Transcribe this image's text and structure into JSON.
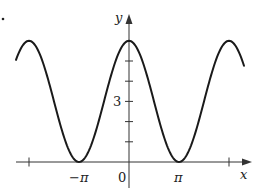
{
  "chart_data": {
    "type": "line",
    "title": "",
    "function": "y = 3 + 3cos(x)",
    "xlabel": "x",
    "ylabel": "y",
    "x_tick_labels": [
      "−π",
      "0",
      "π"
    ],
    "x_ticks": [
      "-2π",
      "-π",
      "0",
      "π",
      "2π"
    ],
    "y_tick_labels": [
      "3"
    ],
    "y_ticks": [
      1,
      2,
      3,
      4,
      5
    ],
    "xlim": [
      "-2.26π",
      "2.3π"
    ],
    "ylim": [
      0,
      6
    ],
    "grid": false,
    "series": [
      {
        "name": "y = 3 + 3cos x",
        "x": [
          "-2π",
          "-π",
          "0",
          "π",
          "2π"
        ],
        "values": [
          6,
          0,
          6,
          0,
          6
        ]
      }
    ],
    "annotations": [
      "maximum 6 at x = 0, ±2π",
      "minimum 0 at x = ±π"
    ]
  },
  "labels": {
    "x_axis": "x",
    "y_axis": "y",
    "origin": "0",
    "neg_pi": "−π",
    "pi": "π",
    "three": "3"
  },
  "style": {
    "curve_color": "#1a1a1a",
    "axis_color": "#333333"
  }
}
